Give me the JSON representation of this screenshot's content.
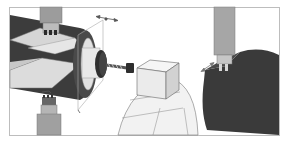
{
  "figure": {
    "type": "technical-illustration",
    "text_labels": [],
    "colors": {
      "background": "#ffffff",
      "frame": "#b8b8b8",
      "dark_part": "#3a3a3a",
      "mid_gray": "#8c8c8c",
      "light_gray": "#d9d9d9",
      "very_light": "#ededed",
      "outline": "#6a6a6a"
    },
    "panels": [
      {
        "name": "left-workpiece-with-mill-cutters",
        "elements": [
          "top-end-mill",
          "bottom-end-mill",
          "cylindrical-workpiece",
          "flat-face",
          "motion-arrow",
          "chuck-disc",
          "drill-bit"
        ]
      },
      {
        "name": "center-cube-on-chuck",
        "elements": [
          "drill-holder",
          "cube-block",
          "jaw-segments"
        ]
      },
      {
        "name": "right-milling-on-dark-part",
        "elements": [
          "vertical-spindle",
          "end-mill",
          "feed-arrow",
          "dark-cylinder"
        ]
      }
    ]
  }
}
